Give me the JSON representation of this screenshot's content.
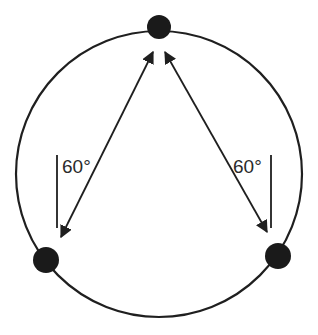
{
  "diagram": {
    "type": "circle-with-three-points",
    "colors": {
      "stroke": "#1f1f1f",
      "dot": "#1a1a1a",
      "text": "#2a2a2a",
      "background": "#ffffff"
    },
    "circle": {
      "cx": 159,
      "cy": 174,
      "r": 143
    },
    "points": [
      {
        "name": "top",
        "cx": 159,
        "cy": 27,
        "r": 12
      },
      {
        "name": "bottom-left",
        "cx": 46,
        "cy": 260,
        "r": 13
      },
      {
        "name": "bottom-right",
        "cx": 278,
        "cy": 256,
        "r": 13
      }
    ],
    "arrows": [
      {
        "name": "left-chord",
        "x1": 153,
        "y1": 52,
        "x2": 61,
        "y2": 237
      },
      {
        "name": "right-chord",
        "x1": 165,
        "y1": 52,
        "x2": 267,
        "y2": 232
      }
    ],
    "angle_markers": [
      {
        "name": "left",
        "label": "60°",
        "line_x": 57,
        "y1": 155,
        "y2": 228,
        "label_x": 62,
        "label_y": 173
      },
      {
        "name": "right",
        "label": "60°",
        "line_x": 271,
        "y1": 155,
        "y2": 228,
        "label_x": 233,
        "label_y": 173
      }
    ]
  }
}
